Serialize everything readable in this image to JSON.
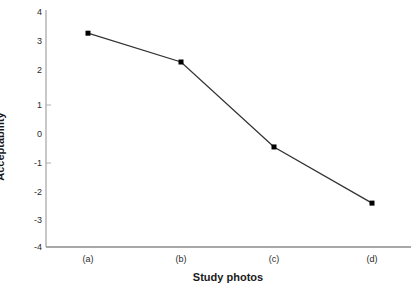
{
  "chart_data": {
    "type": "line",
    "title": "",
    "xlabel": "Study photos",
    "ylabel": "Acceptability",
    "categories": [
      "(a)",
      "(b)",
      "(c)",
      "(d)"
    ],
    "values": [
      3.5,
      2.5,
      -0.45,
      -2.4
    ],
    "series": [
      {
        "name": "Acceptability",
        "values": [
          3.5,
          2.5,
          -0.45,
          -2.4
        ]
      }
    ],
    "ylim": [
      -4,
      4
    ],
    "yticks": [
      4,
      3,
      2,
      1,
      0,
      -1,
      -2,
      -3,
      -4
    ],
    "ytick_labels": [
      "4",
      "3",
      "2",
      "1",
      "0",
      "-1",
      "-2",
      "-3",
      "-4"
    ],
    "xtick_labels": [
      "(a)",
      "(b)",
      "(c)",
      "(d)"
    ],
    "grid": false,
    "legend": null,
    "line_color": "#333333",
    "marker_color": "#000000",
    "axis_color": "#aaaaaa",
    "background": "#ffffff"
  }
}
